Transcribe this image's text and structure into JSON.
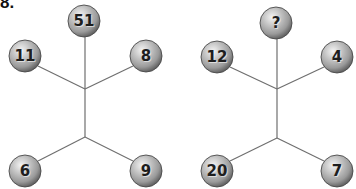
{
  "puzzle": {
    "number_label": "8."
  },
  "colors": {
    "ball_highlight": "#f2f2f2",
    "ball_mid": "#b5b5b5",
    "ball_shadow": "#6a6a6a",
    "line": "#6f6f6f",
    "text": "#1e1e1e"
  },
  "figures": [
    {
      "name": "left-figure",
      "hub_top": [
        85,
        89
      ],
      "hub_bottom": [
        85,
        137
      ],
      "balls": {
        "top": {
          "value": "51",
          "cx": 84,
          "cy": 21
        },
        "upper_left": {
          "value": "11",
          "cx": 25,
          "cy": 56
        },
        "upper_right": {
          "value": "8",
          "cx": 146,
          "cy": 56
        },
        "lower_left": {
          "value": "6",
          "cx": 25,
          "cy": 171
        },
        "lower_right": {
          "value": "9",
          "cx": 146,
          "cy": 171
        }
      }
    },
    {
      "name": "right-figure",
      "hub_top": [
        277,
        89
      ],
      "hub_bottom": [
        277,
        138
      ],
      "balls": {
        "top": {
          "value": "?",
          "cx": 276,
          "cy": 23
        },
        "upper_left": {
          "value": "12",
          "cx": 217,
          "cy": 57
        },
        "upper_right": {
          "value": "4",
          "cx": 337,
          "cy": 57
        },
        "lower_left": {
          "value": "20",
          "cx": 217,
          "cy": 171
        },
        "lower_right": {
          "value": "7",
          "cx": 337,
          "cy": 171
        }
      }
    }
  ]
}
